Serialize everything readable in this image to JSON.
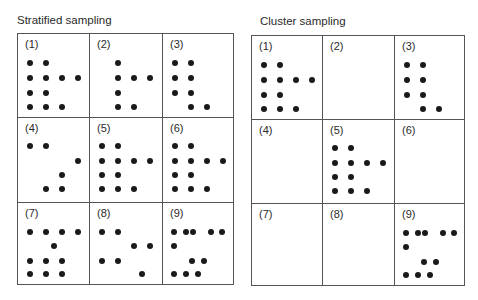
{
  "panels": [
    {
      "title": "Stratified sampling",
      "cells": [
        {
          "label": "(1)",
          "dots": [
            [
              12,
              29
            ],
            [
              28,
              29
            ],
            [
              12,
              44
            ],
            [
              28,
              44
            ],
            [
              44,
              44
            ],
            [
              60,
              44
            ],
            [
              12,
              59
            ],
            [
              28,
              59
            ],
            [
              12,
              73
            ],
            [
              28,
              73
            ],
            [
              44,
              73
            ]
          ]
        },
        {
          "label": "(2)",
          "dots": [
            [
              28,
              29
            ],
            [
              28,
              44
            ],
            [
              44,
              44
            ],
            [
              60,
              44
            ],
            [
              28,
              59
            ],
            [
              28,
              73
            ],
            [
              44,
              73
            ]
          ]
        },
        {
          "label": "(3)",
          "dots": [
            [
              12,
              29
            ],
            [
              28,
              29
            ],
            [
              12,
              44
            ],
            [
              28,
              44
            ],
            [
              12,
              59
            ],
            [
              28,
              59
            ],
            [
              28,
              73
            ],
            [
              44,
              73
            ]
          ]
        },
        {
          "label": "(4)",
          "dots": [
            [
              12,
              28
            ],
            [
              28,
              28
            ],
            [
              60,
              43
            ],
            [
              44,
              57
            ],
            [
              28,
              71
            ],
            [
              44,
              71
            ]
          ]
        },
        {
          "label": "(5)",
          "dots": [
            [
              12,
              28
            ],
            [
              28,
              28
            ],
            [
              12,
              43
            ],
            [
              28,
              43
            ],
            [
              44,
              43
            ],
            [
              60,
              43
            ],
            [
              12,
              57
            ],
            [
              28,
              57
            ],
            [
              12,
              71
            ],
            [
              28,
              71
            ],
            [
              44,
              71
            ]
          ]
        },
        {
          "label": "(6)",
          "dots": [
            [
              12,
              28
            ],
            [
              28,
              28
            ],
            [
              12,
              43
            ],
            [
              28,
              43
            ],
            [
              44,
              43
            ],
            [
              60,
              43
            ],
            [
              12,
              57
            ],
            [
              28,
              57
            ],
            [
              12,
              71
            ],
            [
              28,
              71
            ],
            [
              44,
              71
            ]
          ]
        },
        {
          "label": "(7)",
          "dots": [
            [
              12,
              29
            ],
            [
              28,
              29
            ],
            [
              44,
              29
            ],
            [
              60,
              29
            ],
            [
              36,
              43
            ],
            [
              12,
              58
            ],
            [
              28,
              58
            ],
            [
              44,
              58
            ],
            [
              12,
              71
            ],
            [
              28,
              71
            ],
            [
              44,
              71
            ]
          ]
        },
        {
          "label": "(8)",
          "dots": [
            [
              12,
              29
            ],
            [
              28,
              29
            ],
            [
              44,
              43
            ],
            [
              60,
              43
            ],
            [
              12,
              58
            ],
            [
              28,
              58
            ],
            [
              52,
              71
            ]
          ]
        },
        {
          "label": "(9)",
          "dots": [
            [
              11,
              29
            ],
            [
              23,
              29
            ],
            [
              30,
              29
            ],
            [
              48,
              29
            ],
            [
              59,
              29
            ],
            [
              11,
              43
            ],
            [
              29,
              58
            ],
            [
              41,
              58
            ],
            [
              11,
              71
            ],
            [
              23,
              71
            ],
            [
              35,
              71
            ]
          ]
        }
      ]
    },
    {
      "title": "Cluster sampling",
      "cells": [
        {
          "label": "(1)",
          "dots": [
            [
              12,
              29
            ],
            [
              28,
              29
            ],
            [
              12,
              44
            ],
            [
              28,
              44
            ],
            [
              44,
              44
            ],
            [
              60,
              44
            ],
            [
              12,
              59
            ],
            [
              28,
              59
            ],
            [
              12,
              73
            ],
            [
              28,
              73
            ],
            [
              44,
              73
            ]
          ]
        },
        {
          "label": "(2)",
          "dots": []
        },
        {
          "label": "(3)",
          "dots": [
            [
              12,
              29
            ],
            [
              28,
              29
            ],
            [
              12,
              44
            ],
            [
              28,
              44
            ],
            [
              12,
              59
            ],
            [
              28,
              59
            ],
            [
              28,
              73
            ],
            [
              44,
              73
            ]
          ]
        },
        {
          "label": "(4)",
          "dots": []
        },
        {
          "label": "(5)",
          "dots": [
            [
              12,
              28
            ],
            [
              28,
              28
            ],
            [
              12,
              43
            ],
            [
              28,
              43
            ],
            [
              44,
              43
            ],
            [
              60,
              43
            ],
            [
              12,
              57
            ],
            [
              28,
              57
            ],
            [
              12,
              71
            ],
            [
              28,
              71
            ],
            [
              44,
              71
            ]
          ]
        },
        {
          "label": "(6)",
          "dots": []
        },
        {
          "label": "(7)",
          "dots": []
        },
        {
          "label": "(8)",
          "dots": []
        },
        {
          "label": "(9)",
          "dots": [
            [
              11,
              29
            ],
            [
              23,
              29
            ],
            [
              30,
              29
            ],
            [
              48,
              29
            ],
            [
              59,
              29
            ],
            [
              11,
              43
            ],
            [
              29,
              58
            ],
            [
              41,
              58
            ],
            [
              11,
              71
            ],
            [
              23,
              71
            ],
            [
              35,
              71
            ]
          ]
        }
      ]
    }
  ],
  "colors": {
    "dot": "#1a1a1a",
    "border": "#555555"
  }
}
